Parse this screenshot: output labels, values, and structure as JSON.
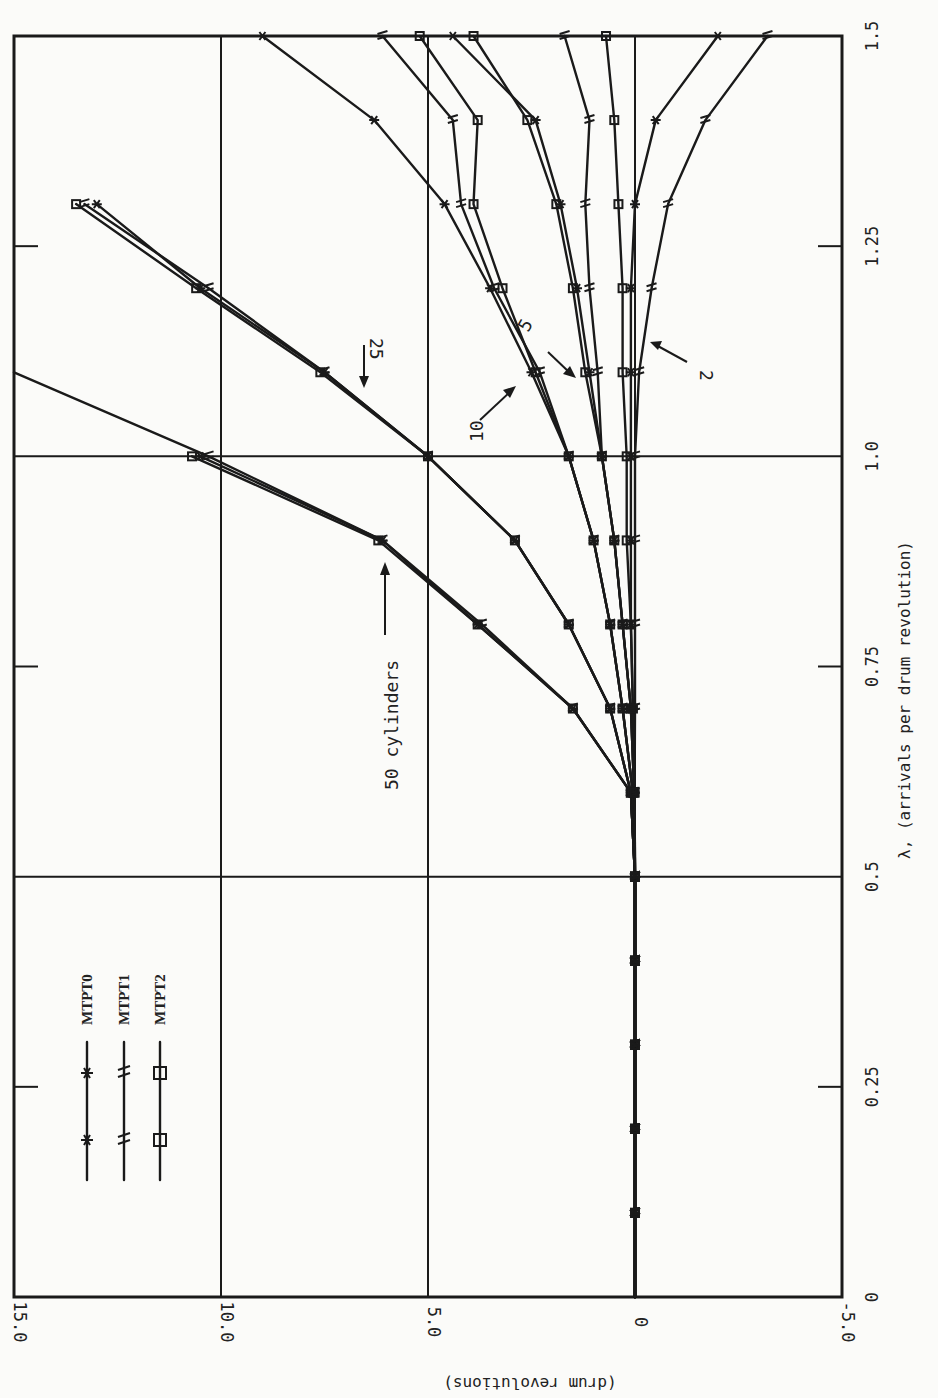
{
  "chart_data": {
    "type": "line",
    "orientation": "rotated 90 degrees counter-clockwise on the page",
    "title": "",
    "xlabel": "λ, (arrivals per drum revolution)",
    "ylabel": "(drum revolutions)",
    "xlim": [
      0,
      1.5
    ],
    "ylim": [
      -5.0,
      15.0
    ],
    "x_ticks": [
      "0",
      "0.25",
      "0.5",
      "0.75",
      "1.0",
      "1.25",
      "1.5"
    ],
    "y_ticks": [
      "-5.0",
      "0",
      "5.0",
      "10.0",
      "15.0"
    ],
    "grid": {
      "x_lines": [
        0.5,
        1.0
      ],
      "y_lines": [
        0,
        5.0,
        10.0
      ]
    },
    "legend": {
      "position": "upper-left (lower-left on page)",
      "entries": [
        {
          "label": "MTPT0",
          "marker": "asterisk"
        },
        {
          "label": "MTPT1",
          "marker": "double-slash"
        },
        {
          "label": "MTPT2",
          "marker": "square"
        }
      ]
    },
    "annotations": [
      "50 cylinders",
      "25",
      "10",
      "5",
      "2"
    ],
    "x": [
      0.1,
      0.2,
      0.3,
      0.4,
      0.5,
      0.6,
      0.7,
      0.8,
      0.9,
      1.0,
      1.1,
      1.2,
      1.3,
      1.4,
      1.5
    ],
    "series": [
      {
        "name": "50 cylinders MTPT0",
        "values": [
          0,
          0,
          0,
          0,
          0,
          0.1,
          1.5,
          3.8,
          6.1,
          10.5,
          16.0,
          null,
          null,
          null,
          null
        ]
      },
      {
        "name": "50 cylinders MTPT1",
        "values": [
          0,
          0,
          0,
          0,
          0,
          0.1,
          1.5,
          3.7,
          6.1,
          10.3,
          15.8,
          null,
          null,
          null,
          null
        ]
      },
      {
        "name": "50 cylinders MTPT2",
        "values": [
          0,
          0,
          0,
          0,
          0,
          0.1,
          1.5,
          3.8,
          6.2,
          10.7,
          16.2,
          null,
          null,
          null,
          null
        ]
      },
      {
        "name": "25 cylinders MTPT0",
        "values": [
          0,
          0,
          0,
          0,
          0,
          0.1,
          0.6,
          1.6,
          2.9,
          5.0,
          7.5,
          10.5,
          13.0,
          null,
          null
        ]
      },
      {
        "name": "25 cylinders MTPT1",
        "values": [
          0,
          0,
          0,
          0,
          0,
          0.1,
          0.6,
          1.6,
          2.9,
          5.0,
          7.5,
          10.3,
          13.3,
          null,
          null
        ]
      },
      {
        "name": "25 cylinders MTPT2",
        "values": [
          0,
          0,
          0,
          0,
          0,
          0.1,
          0.6,
          1.6,
          2.9,
          5.0,
          7.6,
          10.6,
          13.5,
          null,
          null
        ]
      },
      {
        "name": "10 cylinders MTPT0",
        "values": [
          0,
          0,
          0,
          0,
          0,
          0.05,
          0.3,
          0.6,
          1.0,
          1.6,
          2.5,
          3.5,
          4.6,
          6.3,
          9.0
        ]
      },
      {
        "name": "10 cylinders MTPT1",
        "values": [
          0,
          0,
          0,
          0,
          0,
          0.05,
          0.3,
          0.6,
          1.0,
          1.6,
          2.3,
          3.4,
          4.2,
          4.4,
          6.1
        ]
      },
      {
        "name": "10 cylinders MTPT2",
        "values": [
          0,
          0,
          0,
          0,
          0,
          0.05,
          0.3,
          0.6,
          1.0,
          1.6,
          2.4,
          3.2,
          3.9,
          3.8,
          5.2
        ]
      },
      {
        "name": "5 cylinders MTPT0",
        "values": [
          0,
          0,
          0,
          0,
          0,
          0.02,
          0.1,
          0.3,
          0.5,
          0.8,
          1.1,
          1.4,
          1.8,
          2.4,
          4.4
        ]
      },
      {
        "name": "5 cylinders MTPT1",
        "values": [
          0,
          0,
          0,
          0,
          0,
          0.02,
          0.1,
          0.3,
          0.5,
          0.8,
          0.9,
          1.1,
          1.2,
          1.1,
          1.7
        ]
      },
      {
        "name": "5 cylinders MTPT2",
        "values": [
          0,
          0,
          0,
          0,
          0,
          0.02,
          0.1,
          0.3,
          0.5,
          0.8,
          1.2,
          1.5,
          1.9,
          2.6,
          3.9
        ]
      },
      {
        "name": "2 cylinders MTPT0",
        "values": [
          0,
          0,
          0,
          0,
          0,
          0.01,
          0.05,
          0.1,
          0.1,
          0.1,
          0.1,
          0.1,
          0.0,
          -0.5,
          -2.0
        ]
      },
      {
        "name": "2 cylinders MTPT1",
        "values": [
          0,
          0,
          0,
          0,
          0,
          0.01,
          0.0,
          0.0,
          0.0,
          0.0,
          -0.1,
          -0.4,
          -0.8,
          -1.7,
          -3.2
        ]
      },
      {
        "name": "2 cylinders MTPT2",
        "values": [
          0,
          0,
          0,
          0,
          0,
          0.01,
          0.05,
          0.1,
          0.2,
          0.2,
          0.3,
          0.3,
          0.4,
          0.5,
          0.7
        ]
      }
    ]
  },
  "labels": {
    "xlabel": "λ, (arrivals per drum revolution)",
    "ylabel": "(drum revolutions)",
    "x_ticks": [
      "0",
      "0.25",
      "0.5",
      "0.75",
      "1.0",
      "1.25",
      "1.5"
    ],
    "y_ticks": [
      "-5.0",
      "0",
      "5.0",
      "10.0",
      "15.0"
    ],
    "legend": [
      "MTPT0",
      "MTPT1",
      "MTPT2"
    ],
    "annotations": {
      "c50": "50 cylinders",
      "c25": "25",
      "c10": "10",
      "c5": "5",
      "c2": "2"
    }
  }
}
